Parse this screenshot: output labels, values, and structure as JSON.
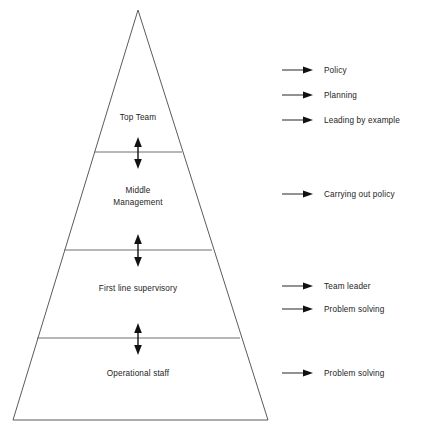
{
  "diagram": {
    "type": "pyramid-hierarchy",
    "title": "",
    "shape": {
      "apex": {
        "x": 138,
        "y": 10
      },
      "base_left": {
        "x": 13,
        "y": 420
      },
      "base_right": {
        "x": 268,
        "y": 420
      },
      "outline_color": "#5b5b5b",
      "divider_color": "#6e6e6e",
      "arrow_color": "#111111"
    },
    "tiers": [
      {
        "id": "top-team",
        "label": "Top Team",
        "label_x": 138,
        "label_y": 117,
        "divider_y": 152
      },
      {
        "id": "middle-management",
        "label": "Middle\nManagement",
        "label_x": 138,
        "label_y": 190,
        "divider_y": 250
      },
      {
        "id": "first-line-supervisory",
        "label": "First line supervisory",
        "label_x": 138,
        "label_y": 288,
        "divider_y": 338
      },
      {
        "id": "operational-staff",
        "label": "Operational staff",
        "label_x": 138,
        "label_y": 373,
        "divider_y": null
      }
    ],
    "connectors": [
      {
        "id": "connector-top-middle",
        "x": 138,
        "y_top": 139,
        "y_bottom": 167
      },
      {
        "id": "connector-middle-firstline",
        "x": 138,
        "y_top": 236,
        "y_bottom": 265
      },
      {
        "id": "connector-firstline-operational",
        "x": 138,
        "y_top": 325,
        "y_bottom": 353
      }
    ]
  },
  "legend": {
    "arrow_x_start": 282,
    "arrow_x_end": 312,
    "text_x": 324,
    "items": [
      {
        "id": "policy",
        "label": "Policy",
        "y": 70
      },
      {
        "id": "planning",
        "label": "Planning",
        "y": 95
      },
      {
        "id": "leading-by-example",
        "label": "Leading by example",
        "y": 120
      },
      {
        "id": "carrying-out-policy",
        "label": "Carrying out policy",
        "y": 194
      },
      {
        "id": "team-leader",
        "label": "Team leader",
        "y": 286
      },
      {
        "id": "problem-solving-supervisory",
        "label": "Problem solving",
        "y": 309
      },
      {
        "id": "problem-solving-operational",
        "label": "Problem solving",
        "y": 373
      }
    ]
  }
}
